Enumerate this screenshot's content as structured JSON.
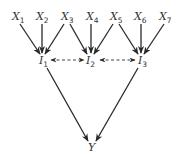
{
  "diagram": {
    "type": "directed-graph",
    "inputs": [
      {
        "id": "X1",
        "base": "X",
        "sub": "1",
        "x": 17,
        "y": 20
      },
      {
        "id": "X2",
        "base": "X",
        "sub": "2",
        "x": 41,
        "y": 20
      },
      {
        "id": "X3",
        "base": "X",
        "sub": "3",
        "x": 66,
        "y": 20
      },
      {
        "id": "X4",
        "base": "X",
        "sub": "4",
        "x": 90,
        "y": 20
      },
      {
        "id": "X5",
        "base": "X",
        "sub": "5",
        "x": 115,
        "y": 20
      },
      {
        "id": "X6",
        "base": "X",
        "sub": "6",
        "x": 139,
        "y": 20
      },
      {
        "id": "X7",
        "base": "X",
        "sub": "7",
        "x": 164,
        "y": 20
      }
    ],
    "intermediates": [
      {
        "id": "I1",
        "base": "I",
        "sub": "1",
        "x": 42,
        "y": 63
      },
      {
        "id": "I2",
        "base": "I",
        "sub": "2",
        "x": 88,
        "y": 63
      },
      {
        "id": "I3",
        "base": "I",
        "sub": "3",
        "x": 140,
        "y": 63
      }
    ],
    "output": {
      "id": "Y",
      "base": "Y",
      "sub": "",
      "x": 91,
      "y": 150
    },
    "edges": [
      {
        "from": "X1",
        "to": "I1",
        "style": "solid"
      },
      {
        "from": "X2",
        "to": "I1",
        "style": "solid"
      },
      {
        "from": "X3",
        "to": "I1",
        "style": "solid"
      },
      {
        "from": "X3",
        "to": "I2",
        "style": "solid"
      },
      {
        "from": "X4",
        "to": "I2",
        "style": "solid"
      },
      {
        "from": "X5",
        "to": "I2",
        "style": "solid"
      },
      {
        "from": "X5",
        "to": "I3",
        "style": "solid"
      },
      {
        "from": "X6",
        "to": "I3",
        "style": "solid"
      },
      {
        "from": "X7",
        "to": "I3",
        "style": "solid"
      },
      {
        "from": "I1",
        "to": "I2",
        "style": "dashed",
        "bidirectional": true
      },
      {
        "from": "I2",
        "to": "I3",
        "style": "dashed",
        "bidirectional": true
      },
      {
        "from": "I1",
        "to": "Y",
        "style": "solid"
      },
      {
        "from": "I3",
        "to": "Y",
        "style": "solid"
      }
    ],
    "colors": {
      "stroke": "#2a2a2a",
      "text": "#333333",
      "background": "#ffffff"
    }
  }
}
